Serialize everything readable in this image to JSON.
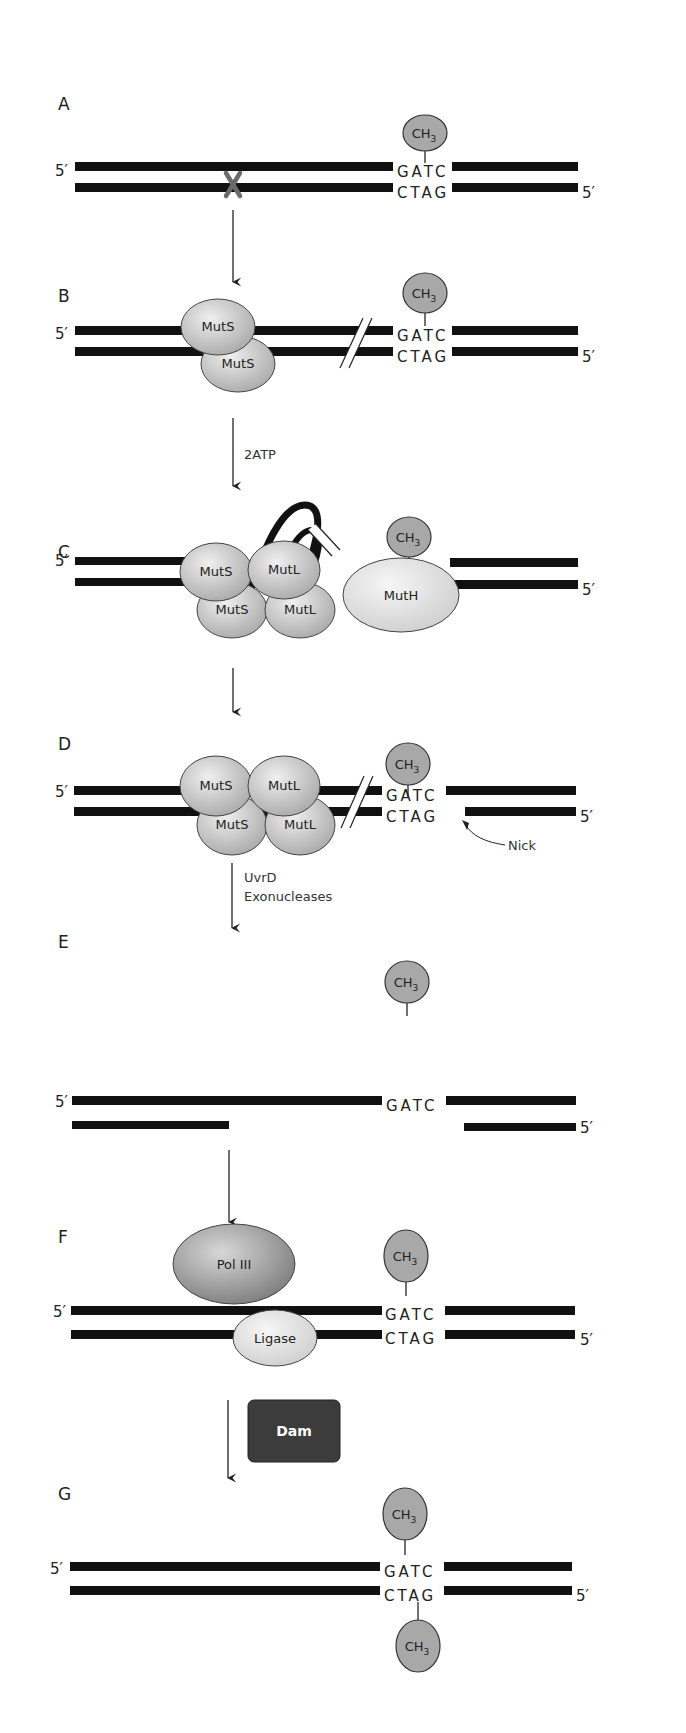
{
  "figure": {
    "panels": [
      {
        "label": "A",
        "top_seq": "GATC",
        "bottom_seq": "CTAG",
        "methyl": "CH3",
        "mismatch_marker": "X"
      },
      {
        "label": "B",
        "top_seq": "GATC",
        "bottom_seq": "CTAG",
        "methyl": "CH3",
        "proteins": [
          "MutS",
          "MutS"
        ]
      },
      {
        "label": "C",
        "methyl": "CH3",
        "proteins": [
          "MutS",
          "MutL",
          "MutS",
          "MutL",
          "MutH"
        ]
      },
      {
        "label": "D",
        "top_seq": "GATC",
        "bottom_seq": "CTAG",
        "methyl": "CH3",
        "proteins": [
          "MutS",
          "MutL",
          "MutS",
          "MutL"
        ],
        "annotation": "Nick"
      },
      {
        "label": "E",
        "top_seq": "GATC",
        "methyl": "CH3"
      },
      {
        "label": "F",
        "top_seq": "GATC",
        "bottom_seq": "CTAG",
        "methyl": "CH3",
        "proteins": [
          "Pol III",
          "Ligase"
        ]
      },
      {
        "label": "G",
        "top_seq": "GATC",
        "bottom_seq": "CTAG",
        "methyl_top": "CH3",
        "methyl_bottom": "CH3"
      }
    ],
    "steps": [
      {
        "from": "A",
        "to": "B",
        "label": ""
      },
      {
        "from": "B",
        "to": "C",
        "label": "2ATP"
      },
      {
        "from": "C",
        "to": "D",
        "label": ""
      },
      {
        "from": "D",
        "to": "E",
        "label_line1": "UvrD",
        "label_line2": "Exonucleases"
      },
      {
        "from": "E",
        "to": "F",
        "label": ""
      },
      {
        "from": "F",
        "to": "G",
        "enzyme": "Dam"
      }
    ],
    "end_labels": {
      "five_prime": "5′"
    },
    "colors": {
      "strand": "#111111",
      "methyl_fill": "#a8a8a8",
      "protein_fill": "#c4c4c4",
      "protein_light": "#e2e2e2",
      "pol_fill": "#8e8e8e",
      "dam_fill": "#3c3c3c",
      "mismatch": "#6a6a6a"
    }
  }
}
